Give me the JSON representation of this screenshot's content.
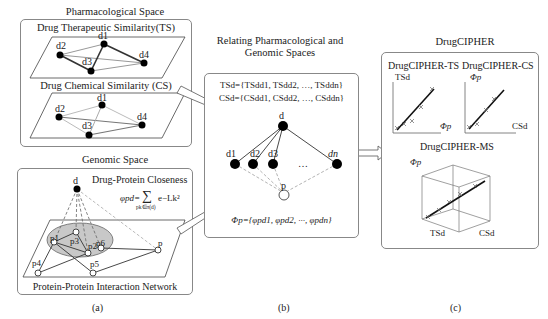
{
  "panel_a": {
    "pharm_title": "Pharmacological Space",
    "ts_title": "Drug Therapeutic Similarity(TS)",
    "cs_title": "Drug Chemical Similarity (CS)",
    "genomic_title": "Genomic Space",
    "closeness_title": "Drug-Protein Closeness",
    "formula_lhs": "φpd=",
    "formula_sum": "∑",
    "formula_sub": "pk∈π(d)",
    "formula_rhs": "e−Lk²",
    "ppi_title": "Protein-Protein Interaction Network",
    "drug_nodes": [
      "d1",
      "d2",
      "d3",
      "d4"
    ],
    "drug_node": "d",
    "protein_nodes": [
      "p1",
      "p2",
      "p3",
      "p4",
      "p5",
      "p6",
      "p"
    ],
    "caption": "(a)"
  },
  "panel_b": {
    "title_line1": "Relating Pharmacological and",
    "title_line2": "Genomic Spaces",
    "ts_formula": "TSd={TSdd1, TSdd2, …, TSddn}",
    "cs_formula": "CSd={CSdd1, CSdd2, …, CSddn}",
    "top_node": "d",
    "nodes": [
      "d1",
      "d2",
      "d3",
      "…",
      "dn"
    ],
    "protein_node": "p",
    "phi_formula": "Φp={φpd1, φpd2, ···, φpdn}",
    "caption": "(b)"
  },
  "panel_c": {
    "title": "DrugCIPHER",
    "ts_plot": {
      "title": "DrugCIPHER-TS",
      "ylabel": "TSd",
      "xlabel": "Φp"
    },
    "cs_plot": {
      "title": "DrugCIPHER-CS",
      "ylabel": "Φp",
      "xlabel": "CSd"
    },
    "ms_plot": {
      "title": "DrugCIPHER-MS",
      "zlabel": "Φp",
      "xlabel": "TSd",
      "ylabel": "CSd"
    },
    "caption": "(c)"
  }
}
